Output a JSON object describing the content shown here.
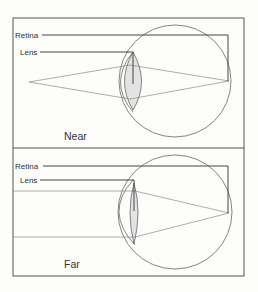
{
  "figure": {
    "panels": [
      {
        "id": "near",
        "caption": "Near",
        "labels": {
          "retina": "Retina",
          "lens": "Lens"
        },
        "description": "Rays diverge from a near point source, lens is thick (accommodated), focusing on retina"
      },
      {
        "id": "far",
        "caption": "Far",
        "labels": {
          "retina": "Retina",
          "lens": "Lens"
        },
        "description": "Parallel rays from a far object, lens is thin (relaxed), focusing on retina"
      }
    ],
    "colors": {
      "line": "#555555",
      "lens_fill": "#e3e3e3",
      "background": "#fdfdfb"
    }
  }
}
